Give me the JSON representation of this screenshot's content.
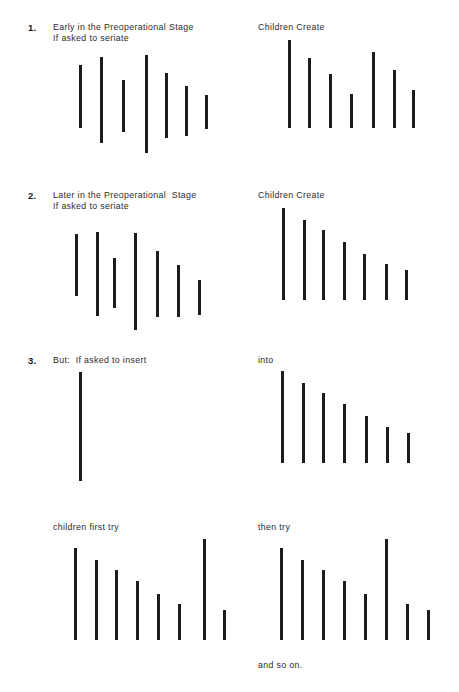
{
  "figure": {
    "title_text_present": false,
    "bar_color": "#1c1c1c",
    "background_color": "#ffffff"
  },
  "sections": [
    {
      "number": "1.",
      "heading_line1": "Early in the Preoperational Stage",
      "heading_line2": "If asked to seriate",
      "right_heading": "Children Create"
    },
    {
      "number": "2.",
      "heading_line1": "Later in the Preoperational  Stage",
      "heading_line2": "If asked to seriate",
      "right_heading": "Children Create"
    },
    {
      "number": "3.",
      "heading_line1": "But:  If asked to insert",
      "heading_line2": "",
      "right_heading": "into"
    }
  ],
  "bottom": {
    "left_heading": "children first try",
    "right_heading": "then try",
    "footer": "and so on."
  },
  "chart_data": {
    "type": "bar",
    "xlabel": "",
    "ylabel": "stick length",
    "grid": false,
    "legend": "none",
    "note": "Each panel shows a row of vertical sticks. Values are stick lengths in px; 'top' is the y offset of the stick top within its panel, since early-stage sticks are not aligned to a common baseline.",
    "panels": [
      {
        "id": "s1-left",
        "label": "1. Early in the Preoperational Stage / If asked to seriate",
        "aligned_baseline": false,
        "x": [
          79,
          100,
          122,
          145,
          165,
          185,
          205
        ],
        "values": [
          63,
          86,
          52,
          98,
          65,
          50,
          34
        ],
        "tops": [
          65,
          57,
          80,
          55,
          73,
          86,
          95
        ]
      },
      {
        "id": "s1-right",
        "label": "Children Create",
        "aligned_baseline": true,
        "baseline": 128,
        "x": [
          288,
          308,
          329,
          350,
          372,
          393,
          412
        ],
        "values": [
          88,
          70,
          54,
          34,
          76,
          58,
          38
        ]
      },
      {
        "id": "s2-left",
        "label": "2. Later in the Preoperational Stage / If asked to seriate",
        "aligned_baseline": false,
        "x": [
          75,
          96,
          113,
          134,
          156,
          177,
          198
        ],
        "values": [
          62,
          84,
          50,
          97,
          66,
          52,
          35
        ],
        "tops": [
          234,
          232,
          258,
          233,
          251,
          265,
          280
        ]
      },
      {
        "id": "s2-right",
        "label": "Children Create",
        "aligned_baseline": true,
        "baseline": 300,
        "x": [
          282,
          303,
          322,
          343,
          363,
          385,
          405
        ],
        "values": [
          92,
          80,
          70,
          58,
          46,
          36,
          30
        ]
      },
      {
        "id": "s3-left",
        "label": "3. But: If asked to insert",
        "aligned_baseline": false,
        "x": [
          79
        ],
        "values": [
          109
        ],
        "tops": [
          372
        ]
      },
      {
        "id": "s3-right",
        "label": "into",
        "aligned_baseline": true,
        "baseline": 463,
        "x": [
          281,
          302,
          322,
          343,
          365,
          386,
          407
        ],
        "values": [
          92,
          80,
          70,
          59,
          47,
          36,
          30
        ]
      },
      {
        "id": "bottom-left",
        "label": "children first try",
        "aligned_baseline": true,
        "baseline": 640,
        "x": [
          74,
          95,
          115,
          136,
          157,
          178,
          203,
          223
        ],
        "values": [
          92,
          80,
          70,
          59,
          46,
          36,
          101,
          30
        ]
      },
      {
        "id": "bottom-right",
        "label": "then try",
        "aligned_baseline": true,
        "baseline": 640,
        "x": [
          280,
          301,
          322,
          343,
          364,
          385,
          406,
          427
        ],
        "values": [
          92,
          80,
          70,
          59,
          46,
          101,
          36,
          30
        ]
      }
    ]
  }
}
